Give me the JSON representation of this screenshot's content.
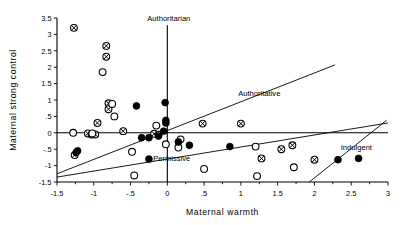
{
  "chart_data": {
    "type": "scatter",
    "title": "",
    "xlabel": "Maternal warmth",
    "ylabel": "Maternal strong control",
    "xlim": [
      -1.5,
      3
    ],
    "ylim": [
      -1.5,
      3.5
    ],
    "grid": false,
    "legend_position": "none",
    "xticks": [
      -1.5,
      -1,
      -0.5,
      0,
      0.5,
      1,
      1.5,
      2,
      2.5,
      3
    ],
    "xticklabels": [
      "-1.5",
      "-1",
      "-.5",
      "0",
      ".5",
      "1",
      "1.5",
      "2",
      "2.5",
      "3"
    ],
    "yticks": [
      -1.5,
      -1,
      -0.5,
      0,
      0.5,
      1,
      1.5,
      2,
      2.5,
      3,
      3.5
    ],
    "yticklabels": [
      "-1.5",
      "-1",
      "-.5",
      "0",
      ".5",
      "1",
      "1.5",
      "2",
      "2.5",
      "3",
      "3.5"
    ],
    "annotations": [
      {
        "text": "Authoritarian",
        "x": 0.02,
        "y": 3.42,
        "anchor": "middle"
      },
      {
        "text": "Authoritative",
        "x": 1.25,
        "y": 1.12,
        "anchor": "middle"
      },
      {
        "text": "Permissive",
        "x": 0.06,
        "y": -0.86,
        "anchor": "middle"
      },
      {
        "text": "Indulgent",
        "x": 2.57,
        "y": -0.52,
        "anchor": "middle"
      }
    ],
    "reference_lines": [
      {
        "name": "zero-horizontal",
        "x1": -1.5,
        "y1": 0,
        "x2": 3,
        "y2": 0
      },
      {
        "name": "zero-vertical",
        "x1": 0,
        "y1": -1.5,
        "x2": 0,
        "y2": 3.28
      },
      {
        "name": "authoritative-upper-boundary",
        "x1": -1.5,
        "y1": -1.25,
        "x2": 2.28,
        "y2": 2.07
      },
      {
        "name": "permissive-lower-boundary",
        "x1": -1.5,
        "y1": -1.35,
        "x2": 3.0,
        "y2": 0.3
      },
      {
        "name": "indulgent-boundary",
        "x1": 1.93,
        "y1": -1.5,
        "x2": 2.98,
        "y2": 0.38
      }
    ],
    "series": [
      {
        "name": "crossed-circle",
        "marker": "crossed-circle",
        "points": [
          [
            -1.27,
            3.2
          ],
          [
            -0.83,
            2.65
          ],
          [
            -0.83,
            2.32
          ],
          [
            -0.8,
            0.9
          ],
          [
            -0.8,
            0.72
          ],
          [
            -0.95,
            0.3
          ],
          [
            -1.08,
            -0.02
          ],
          [
            -1.03,
            -0.05
          ],
          [
            -0.98,
            -0.05
          ],
          [
            -0.6,
            0.05
          ],
          [
            -1.26,
            -0.68
          ],
          [
            -0.18,
            -0.03
          ],
          [
            -0.12,
            -0.06
          ],
          [
            0.48,
            0.28
          ],
          [
            1.0,
            0.28
          ],
          [
            1.55,
            -0.5
          ],
          [
            1.7,
            -0.38
          ],
          [
            1.28,
            -0.78
          ],
          [
            2.0,
            -0.82
          ]
        ]
      },
      {
        "name": "open-circle",
        "marker": "open-circle",
        "points": [
          [
            -0.88,
            1.85
          ],
          [
            -0.72,
            0.5
          ],
          [
            -1.28,
            0.0
          ],
          [
            -1.02,
            -0.02
          ],
          [
            -0.75,
            0.88
          ],
          [
            -0.48,
            -0.58
          ],
          [
            -0.15,
            0.22
          ],
          [
            -0.02,
            -0.35
          ],
          [
            0.15,
            -0.45
          ],
          [
            0.18,
            -0.2
          ],
          [
            -0.45,
            -1.3
          ],
          [
            0.5,
            -1.1
          ],
          [
            1.2,
            -0.42
          ],
          [
            1.22,
            -1.32
          ],
          [
            1.72,
            -1.05
          ]
        ]
      },
      {
        "name": "filled-circle",
        "marker": "filled-circle",
        "points": [
          [
            -0.42,
            0.82
          ],
          [
            -0.35,
            -0.15
          ],
          [
            -0.25,
            -0.15
          ],
          [
            -0.12,
            -0.1
          ],
          [
            -1.22,
            -0.55
          ],
          [
            -1.24,
            -0.6
          ],
          [
            -0.02,
            0.38
          ],
          [
            -0.02,
            0.3
          ],
          [
            -0.05,
            0.05
          ],
          [
            0.15,
            -0.28
          ],
          [
            0.3,
            -0.38
          ],
          [
            -0.25,
            -0.8
          ],
          [
            0.85,
            -0.42
          ],
          [
            2.32,
            -0.82
          ],
          [
            2.6,
            -0.78
          ],
          [
            -0.03,
            0.92
          ]
        ]
      }
    ]
  }
}
